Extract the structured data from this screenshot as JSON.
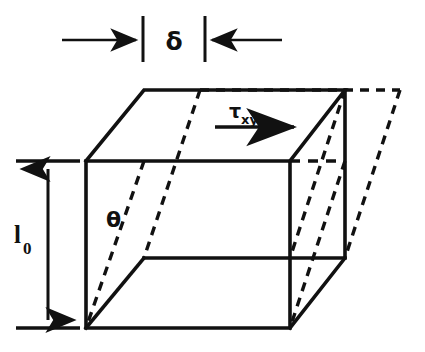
{
  "figure": {
    "background_color": "#ffffff",
    "ink_color": "#111111",
    "labels": {
      "delta": "δ",
      "theta": "θ",
      "tau_base": "τ",
      "tau_sub": "xy",
      "length_base": "l",
      "length_sub": "0"
    },
    "annotations": {
      "delta_label": "δ",
      "theta_label": "θ",
      "shear_stress_label": "τxy",
      "original_length_label": "l0"
    },
    "geometry": {
      "front_face": {
        "top_left": [
          86,
          161
        ],
        "top_right": [
          290,
          161
        ],
        "bottom_right": [
          290,
          328
        ],
        "bottom_left": [
          86,
          328
        ]
      },
      "back_face": {
        "top_left": [
          144,
          90
        ],
        "top_right": [
          345,
          90
        ],
        "bottom_right": [
          345,
          258
        ],
        "bottom_left": [
          144,
          258
        ]
      },
      "sheared_back_face": {
        "top_left": [
          200,
          90
        ],
        "top_right": [
          400,
          90
        ],
        "bottom_right": [
          345,
          258
        ],
        "bottom_left": [
          144,
          258
        ]
      },
      "delta_dimension": {
        "left_tick_x": 143,
        "right_tick_x": 205,
        "tick_top_y": 16,
        "tick_bottom_y": 62,
        "arrow_y": 40,
        "left_arrow_start_x": 62,
        "right_arrow_end_x": 282
      },
      "length_dimension": {
        "x": 48,
        "top_y": 161,
        "bottom_y": 328,
        "tick_left_x": 16,
        "tick_right_x": 80
      },
      "shear_arrow": {
        "start": [
          215,
          127
        ],
        "end": [
          300,
          127
        ]
      }
    }
  }
}
